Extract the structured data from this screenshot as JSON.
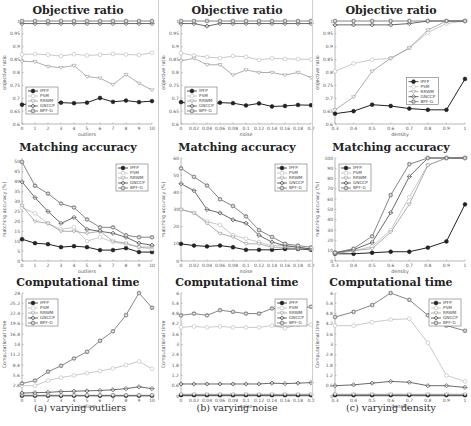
{
  "captions": [
    "(a) varying outliers",
    "(b) varying noise",
    "(c) varying density"
  ],
  "legend": [
    "IPFP",
    "PSM",
    "RRWM",
    "GNCCP",
    "BPF-G"
  ],
  "series_styles": {
    "IPFP": {
      "color": "#222222",
      "marker": "filled-circle"
    },
    "PSM": {
      "color": "#bbbbbb",
      "marker": "open-circle"
    },
    "RRWM": {
      "color": "#999999",
      "marker": "triangle"
    },
    "GNCCP": {
      "color": "#444444",
      "marker": "diamond"
    },
    "BPF-G": {
      "color": "#666666",
      "marker": "square-circle"
    }
  },
  "chart_data": [
    {
      "type": "line",
      "panel": "a",
      "row": 0,
      "title": "Objective ratio",
      "xlabel": "outliers",
      "ylabel": "objective ratio",
      "x": [
        0,
        1,
        2,
        3,
        4,
        5,
        6,
        7,
        8,
        9,
        10
      ],
      "xticks": [
        "0",
        "1",
        "2",
        "3",
        "4",
        "5",
        "6",
        "7",
        "8",
        "9",
        "10"
      ],
      "yticks": [
        "0.6",
        "0.65",
        "0.7",
        "0.75",
        "0.8",
        "0.85",
        "0.9",
        "0.95",
        "1"
      ],
      "ylim": [
        0.6,
        1.0
      ],
      "legend_position": "lower-left",
      "series": [
        {
          "name": "IPFP",
          "values": [
            0.675,
            0.682,
            0.682,
            0.683,
            0.681,
            0.683,
            0.701,
            0.686,
            0.691,
            0.685,
            0.689
          ]
        },
        {
          "name": "PSM",
          "values": [
            0.87,
            0.872,
            0.869,
            0.864,
            0.871,
            0.866,
            0.869,
            0.872,
            0.87,
            0.868,
            0.877
          ]
        },
        {
          "name": "RRWM",
          "values": [
            0.843,
            0.842,
            0.823,
            0.819,
            0.827,
            0.784,
            0.778,
            0.753,
            0.792,
            0.758,
            0.732
          ]
        },
        {
          "name": "GNCCP",
          "values": [
            0.99,
            0.99,
            0.99,
            0.99,
            0.99,
            0.99,
            0.99,
            0.99,
            0.99,
            0.99,
            0.99
          ]
        },
        {
          "name": "BPF-G",
          "values": [
            1.0,
            1.0,
            1.0,
            1.0,
            1.0,
            1.0,
            1.0,
            1.0,
            1.0,
            1.0,
            1.0
          ]
        }
      ]
    },
    {
      "type": "line",
      "panel": "b",
      "row": 0,
      "title": "Objective ratio",
      "xlabel": "noise",
      "ylabel": "objective ratio",
      "x": [
        0,
        0.02,
        0.04,
        0.06,
        0.08,
        0.1,
        0.12,
        0.14,
        0.16,
        0.18,
        0.2
      ],
      "xticks": [
        "0",
        "0.02",
        "0.04",
        "0.06",
        "0.08",
        "0.1",
        "0.12",
        "0.14",
        "0.16",
        "0.18",
        "0.2"
      ],
      "yticks": [
        "0.6",
        "0.65",
        "0.7",
        "0.75",
        "0.8",
        "0.85",
        "0.9",
        "0.95",
        "1"
      ],
      "ylim": [
        0.6,
        1.0
      ],
      "legend_position": "lower-left",
      "series": [
        {
          "name": "IPFP",
          "values": [
            0.685,
            0.675,
            0.675,
            0.683,
            0.681,
            0.672,
            0.68,
            0.668,
            0.67,
            0.674,
            0.673
          ]
        },
        {
          "name": "PSM",
          "values": [
            0.875,
            0.866,
            0.86,
            0.856,
            0.864,
            0.861,
            0.849,
            0.855,
            0.853,
            0.852,
            0.851
          ]
        },
        {
          "name": "RRWM",
          "values": [
            0.845,
            0.855,
            0.83,
            0.83,
            0.79,
            0.81,
            0.8,
            0.8,
            0.79,
            0.8,
            0.78
          ]
        },
        {
          "name": "GNCCP",
          "values": [
            0.99,
            0.99,
            0.98,
            0.99,
            0.99,
            0.99,
            0.99,
            0.99,
            0.99,
            0.99,
            0.99
          ]
        },
        {
          "name": "BPF-G",
          "values": [
            1.0,
            1.0,
            1.0,
            1.0,
            1.0,
            1.0,
            1.0,
            1.0,
            1.0,
            1.0,
            1.0
          ]
        }
      ]
    },
    {
      "type": "line",
      "panel": "c",
      "row": 0,
      "title": "Objective ratio",
      "xlabel": "density",
      "ylabel": "objective ratio",
      "x": [
        0.3,
        0.4,
        0.5,
        0.6,
        0.7,
        0.8,
        0.9,
        1
      ],
      "xticks": [
        "0.3",
        "0.4",
        "0.5",
        "0.6",
        "0.7",
        "0.8",
        "0.9",
        "1"
      ],
      "yticks": [
        "0.6",
        "0.65",
        "0.7",
        "0.75",
        "0.8",
        "0.85",
        "0.9",
        "0.95",
        "1"
      ],
      "ylim": [
        0.6,
        1.0
      ],
      "legend_position": "center-right",
      "series": [
        {
          "name": "IPFP",
          "values": [
            0.64,
            0.65,
            0.675,
            0.67,
            0.66,
            0.655,
            0.655,
            0.775
          ]
        },
        {
          "name": "PSM",
          "values": [
            0.805,
            0.835,
            0.85,
            0.855,
            0.895,
            0.955,
            0.99,
            1.0
          ]
        },
        {
          "name": "RRWM",
          "values": [
            0.655,
            0.705,
            0.805,
            0.855,
            0.895,
            0.965,
            1.0,
            1.0
          ]
        },
        {
          "name": "GNCCP",
          "values": [
            0.985,
            0.985,
            0.985,
            0.985,
            0.99,
            1.0,
            1.0,
            1.0
          ]
        },
        {
          "name": "BPF-G",
          "values": [
            1.0,
            1.0,
            1.0,
            1.0,
            1.0,
            1.0,
            1.0,
            1.0
          ]
        }
      ]
    },
    {
      "type": "line",
      "panel": "a",
      "row": 1,
      "title": "Matching accuracy",
      "xlabel": "outliers",
      "ylabel": "matching accuracy (%)",
      "x": [
        0,
        1,
        2,
        3,
        4,
        5,
        6,
        7,
        8,
        9,
        10
      ],
      "xticks": [
        "0",
        "1",
        "2",
        "3",
        "4",
        "5",
        "6",
        "7",
        "8",
        "9",
        "10"
      ],
      "yticks": [
        "0",
        "5",
        "10",
        "15",
        "20",
        "25",
        "30",
        "35",
        "40",
        "45",
        "50"
      ],
      "ylim": [
        0,
        52
      ],
      "legend_position": "upper-right",
      "series": [
        {
          "name": "IPFP",
          "values": [
            11,
            9,
            8.5,
            7,
            7.5,
            7,
            5.5,
            5.5,
            6.5,
            4.5,
            4.5
          ]
        },
        {
          "name": "PSM",
          "values": [
            27,
            24,
            19,
            16,
            17,
            10,
            12,
            9.5,
            8.5,
            7,
            6
          ]
        },
        {
          "name": "RRWM",
          "values": [
            28,
            20,
            19,
            15,
            15,
            14,
            15,
            10,
            9,
            7,
            7
          ]
        },
        {
          "name": "GNCCP",
          "values": [
            40,
            32,
            25,
            19,
            22,
            16,
            15,
            14,
            12,
            9,
            8
          ]
        },
        {
          "name": "BPF-G",
          "values": [
            50,
            38,
            34,
            29,
            27,
            21,
            17,
            17,
            13,
            12,
            12
          ]
        }
      ]
    },
    {
      "type": "line",
      "panel": "b",
      "row": 1,
      "title": "Matching accuracy",
      "xlabel": "noise",
      "ylabel": "matching accuracy (%)",
      "x": [
        0,
        0.02,
        0.04,
        0.06,
        0.08,
        0.1,
        0.12,
        0.14,
        0.16,
        0.18,
        0.2
      ],
      "xticks": [
        "0",
        "0.02",
        "0.04",
        "0.06",
        "0.08",
        "0.1",
        "0.12",
        "0.14",
        "0.16",
        "0.18",
        "0.2"
      ],
      "yticks": [
        "0",
        "10",
        "20",
        "30",
        "40",
        "50",
        "60"
      ],
      "ylim": [
        0,
        60
      ],
      "legend_position": "upper-right",
      "series": [
        {
          "name": "IPFP",
          "values": [
            10,
            9,
            8.5,
            9,
            8,
            6.5,
            6.5,
            6.5,
            7,
            7,
            6.5
          ]
        },
        {
          "name": "PSM",
          "values": [
            30,
            28,
            23,
            21,
            15,
            13,
            11,
            9,
            9,
            8,
            7
          ]
        },
        {
          "name": "RRWM",
          "values": [
            30,
            28,
            22,
            16,
            14,
            10,
            10,
            8,
            8,
            7,
            7
          ]
        },
        {
          "name": "GNCCP",
          "values": [
            45,
            41,
            30,
            28,
            24,
            22,
            15,
            11,
            9,
            8,
            7
          ]
        },
        {
          "name": "BPF-G",
          "values": [
            54,
            49,
            44,
            36,
            32,
            26,
            18,
            14,
            10,
            9,
            8
          ]
        }
      ]
    },
    {
      "type": "line",
      "panel": "c",
      "row": 1,
      "title": "Matching accuracy",
      "xlabel": "density",
      "ylabel": "matching accuracy (%)",
      "x": [
        0.3,
        0.4,
        0.5,
        0.6,
        0.7,
        0.8,
        0.9,
        1
      ],
      "xticks": [
        "0.3",
        "0.4",
        "0.5",
        "0.6",
        "0.7",
        "0.8",
        "0.9",
        "1"
      ],
      "yticks": [
        "0",
        "10",
        "20",
        "30",
        "40",
        "50",
        "60",
        "70",
        "80",
        "90",
        "100"
      ],
      "ylim": [
        0,
        100
      ],
      "legend_position": "upper-left",
      "series": [
        {
          "name": "IPFP",
          "values": [
            7,
            7,
            8,
            9,
            9,
            13,
            19,
            55
          ]
        },
        {
          "name": "PSM",
          "values": [
            8,
            10,
            14,
            30,
            62,
            93,
            100,
            100
          ]
        },
        {
          "name": "RRWM",
          "values": [
            7,
            10,
            12,
            28,
            55,
            93,
            100,
            100
          ]
        },
        {
          "name": "GNCCP",
          "values": [
            8,
            11,
            18,
            47,
            82,
            100,
            100,
            100
          ]
        },
        {
          "name": "BPF-G",
          "values": [
            8,
            12,
            24,
            64,
            94,
            100,
            100,
            100
          ]
        }
      ]
    },
    {
      "type": "line",
      "panel": "a",
      "row": 2,
      "title": "Computational time",
      "xlabel": "outliers",
      "ylabel": "Computational time",
      "x": [
        0,
        1,
        2,
        3,
        4,
        5,
        6,
        7,
        8,
        9,
        10
      ],
      "xticks": [
        "0",
        "1",
        "2",
        "3",
        "4",
        "5",
        "6",
        "7",
        "8",
        "9",
        "10"
      ],
      "yticks": [
        "2.8",
        "5.6",
        "8.4",
        "11.2",
        "14",
        "16.8",
        "19.6",
        "22.4",
        "25.2",
        "28"
      ],
      "ylim": [
        0,
        28
      ],
      "legend_position": "upper-left",
      "series": [
        {
          "name": "IPFP",
          "values": [
            0.1,
            0.1,
            0.1,
            0.1,
            0.1,
            0.1,
            0.1,
            0.1,
            0.1,
            0.1,
            0.1
          ]
        },
        {
          "name": "PSM",
          "values": [
            2.8,
            2.8,
            4.2,
            5,
            5.6,
            6.2,
            6.8,
            7.5,
            8.4,
            9.4,
            7.4
          ]
        },
        {
          "name": "RRWM",
          "values": [
            0.2,
            0.2,
            0.2,
            0.2,
            0.2,
            0.2,
            0.2,
            0.2,
            0.2,
            0.2,
            0.2
          ]
        },
        {
          "name": "GNCCP",
          "values": [
            0.8,
            0.9,
            1,
            1.2,
            1.3,
            1.4,
            1.5,
            1.7,
            2,
            2.5,
            2
          ]
        },
        {
          "name": "BPF-G",
          "values": [
            3.4,
            4.2,
            6.6,
            8.2,
            10.2,
            12,
            15,
            17.6,
            22,
            28,
            24
          ]
        }
      ]
    },
    {
      "type": "line",
      "panel": "b",
      "row": 2,
      "title": "Computational time",
      "xlabel": "noise",
      "ylabel": "Computational time",
      "x": [
        0,
        0.02,
        0.04,
        0.06,
        0.08,
        0.1,
        0.12,
        0.14,
        0.16,
        0.18,
        0.2
      ],
      "xticks": [
        "0",
        "0.02",
        "0.04",
        "0.06",
        "0.08",
        "0.1",
        "0.12",
        "0.14",
        "0.16",
        "0.18",
        "0.2"
      ],
      "yticks": [
        "0",
        "0.6",
        "1.2",
        "1.8",
        "2.4",
        "3",
        "3.6",
        "4.2",
        "4.8",
        "5.4",
        "6"
      ],
      "ylim": [
        0,
        6
      ],
      "legend_position": "upper-right",
      "series": [
        {
          "name": "IPFP",
          "values": [
            0.05,
            0.05,
            0.05,
            0.05,
            0.05,
            0.05,
            0.05,
            0.05,
            0.05,
            0.05,
            0.05
          ]
        },
        {
          "name": "PSM",
          "values": [
            4.0,
            4.05,
            4.0,
            4.05,
            4.0,
            4.0,
            4.0,
            4.1,
            3.95,
            4.15,
            4.15
          ]
        },
        {
          "name": "RRWM",
          "values": [
            0.1,
            0.1,
            0.1,
            0.1,
            0.1,
            0.1,
            0.1,
            0.1,
            0.1,
            0.1,
            0.1
          ]
        },
        {
          "name": "GNCCP",
          "values": [
            0.7,
            0.7,
            0.7,
            0.7,
            0.7,
            0.7,
            0.7,
            0.75,
            0.72,
            0.75,
            0.78
          ]
        },
        {
          "name": "BPF-G",
          "values": [
            4.7,
            4.8,
            4.7,
            5.0,
            4.9,
            4.8,
            4.8,
            5.1,
            5.05,
            5.1,
            5.2
          ]
        }
      ]
    },
    {
      "type": "line",
      "panel": "c",
      "row": 2,
      "title": "Computational time",
      "xlabel": "density",
      "ylabel": "Computational time",
      "x": [
        0.3,
        0.4,
        0.5,
        0.6,
        0.7,
        0.8,
        0.9,
        1
      ],
      "xticks": [
        "0.3",
        "0.4",
        "0.5",
        "0.6",
        "0.7",
        "0.8",
        "0.9",
        "1"
      ],
      "yticks": [
        "0",
        "0.6",
        "1.2",
        "1.8",
        "2.4",
        "3",
        "3.6",
        "4.2",
        "4.8",
        "5.4",
        "6"
      ],
      "ylim": [
        0,
        6
      ],
      "legend_position": "upper-right",
      "series": [
        {
          "name": "IPFP",
          "values": [
            0.05,
            0.05,
            0.05,
            0.05,
            0.05,
            0.05,
            0.05,
            0.05
          ]
        },
        {
          "name": "PSM",
          "values": [
            4.1,
            4.1,
            4.3,
            4.45,
            4.5,
            3.1,
            1.2,
            0.85
          ]
        },
        {
          "name": "RRWM",
          "values": [
            0.1,
            0.1,
            0.1,
            0.1,
            0.1,
            0.1,
            0.1,
            0.1
          ]
        },
        {
          "name": "GNCCP",
          "values": [
            0.6,
            0.65,
            0.75,
            0.85,
            0.8,
            0.6,
            0.6,
            0.5
          ]
        },
        {
          "name": "BPF-G",
          "values": [
            4.6,
            4.9,
            5.3,
            6.0,
            5.6,
            4.7,
            4.1,
            3.8
          ]
        }
      ]
    }
  ]
}
